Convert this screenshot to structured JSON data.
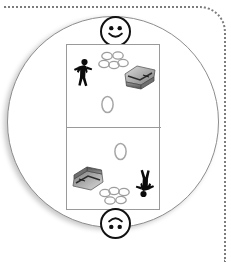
{
  "figure": {
    "background_color": "#ffffff",
    "disc_color": "#ffffff",
    "disc_outline_color": "#8e8e8e",
    "dotted_border_color": "#7c7c7c",
    "card_outline_color": "#9a9a9a",
    "face_outline_color": "#111111"
  },
  "dotted_frame": {
    "name": "dotted-frame",
    "edges": "top-and-right",
    "corner": "rounded"
  },
  "disc": {
    "name": "circle-disc",
    "shape": "circle"
  },
  "card": {
    "name": "scene-card",
    "panel_count": 2,
    "panels": [
      {
        "id": "top-panel",
        "label": "Upper panel",
        "rotation_degrees": 0,
        "objects": [
          {
            "id": "person",
            "icon": "person-silhouette-icon",
            "label": "Person",
            "position": "left"
          },
          {
            "id": "cluster",
            "icon": "ring-cluster-icon",
            "label": "Cluster of rings",
            "position": "top-center"
          },
          {
            "id": "chest",
            "icon": "treasure-chest-icon",
            "label": "Treasure chest",
            "position": "right"
          },
          {
            "id": "ring",
            "icon": "single-ring-icon",
            "label": "Single ring",
            "position": "bottom-center"
          }
        ]
      },
      {
        "id": "bottom-panel",
        "label": "Lower panel",
        "rotation_degrees": 180,
        "objects": [
          {
            "id": "person",
            "icon": "person-silhouette-icon",
            "label": "Person",
            "position": "right"
          },
          {
            "id": "cluster",
            "icon": "ring-cluster-icon",
            "label": "Cluster of rings",
            "position": "bottom-center"
          },
          {
            "id": "chest",
            "icon": "treasure-chest-icon",
            "label": "Treasure chest",
            "position": "left"
          },
          {
            "id": "ring",
            "icon": "single-ring-icon",
            "label": "Single ring",
            "position": "top-center"
          }
        ]
      }
    ]
  },
  "markers": [
    {
      "id": "top-face",
      "icon": "smiley-face-icon",
      "label": "Smiley face marker (upright)",
      "rotation_degrees": 0
    },
    {
      "id": "bottom-face",
      "icon": "smiley-face-icon",
      "label": "Smiley face marker (inverted)",
      "rotation_degrees": 180
    }
  ]
}
